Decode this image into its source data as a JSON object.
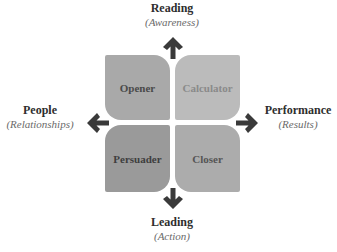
{
  "diagram": {
    "quadrants": [
      {
        "id": "opener",
        "label": "Opener",
        "fill": "#a9a9a9",
        "text_color": "#4a4a4a"
      },
      {
        "id": "calculator",
        "label": "Calculator",
        "fill": "#bbbbbb",
        "text_color": "#8a8a8a"
      },
      {
        "id": "persuader",
        "label": "Persuader",
        "fill": "#9a9a9a",
        "text_color": "#3e3e3e"
      },
      {
        "id": "closer",
        "label": "Closer",
        "fill": "#acacac",
        "text_color": "#555555"
      }
    ],
    "axes": {
      "top": {
        "main": "Reading",
        "sub": "(Awareness)"
      },
      "bottom": {
        "main": "Leading",
        "sub": "(Action)"
      },
      "left": {
        "main": "People",
        "sub": "(Relationships)"
      },
      "right": {
        "main": "Performance",
        "sub": "(Results)"
      }
    },
    "arrow_color": "#3a3a3a"
  }
}
